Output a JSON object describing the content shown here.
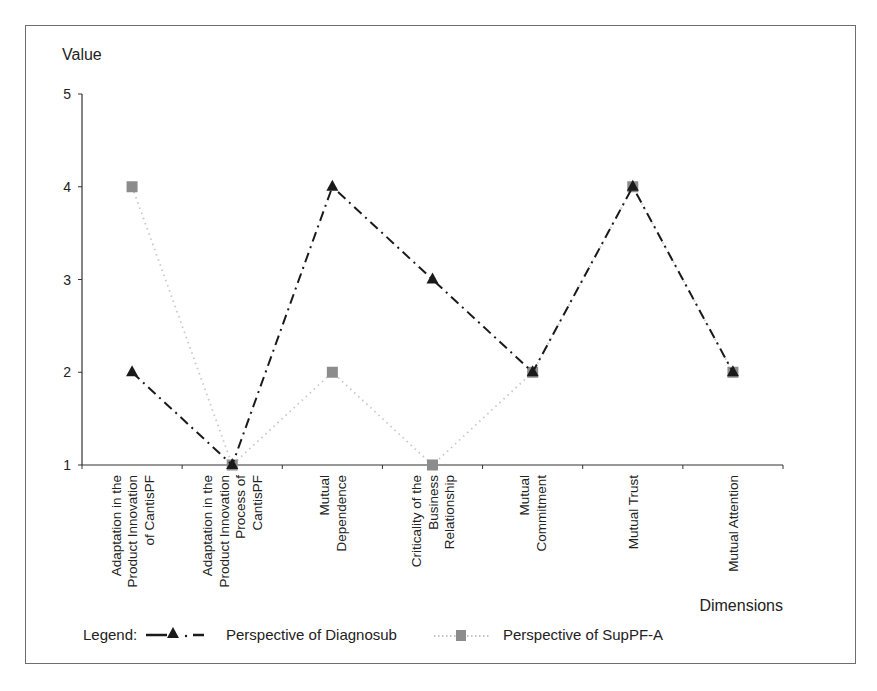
{
  "chart_data": {
    "type": "line",
    "title": "",
    "ylabel": "Value",
    "xlabel": "Dimensions",
    "ylim": [
      1,
      5
    ],
    "yticks": [
      1,
      2,
      3,
      4,
      5
    ],
    "grid": false,
    "legend_position": "bottom",
    "categories": [
      "Adaptation in the Product Innovation of CantisPF",
      "Adaptation in the Product Innovation Process of CantisPF",
      "Mutual Dependence",
      "Criticality of the Business Relationship",
      "Mutual Commitment",
      "Mutual Trust",
      "Mutual Attention"
    ],
    "category_label_lines": [
      [
        "Adaptation in the",
        "Product Innovation",
        "of CantisPF"
      ],
      [
        "Adaptation in the",
        "Product Innovation",
        "Process of",
        "CantisPF"
      ],
      [
        "Mutual",
        "Dependence"
      ],
      [
        "Criticality of the",
        "Business",
        "Relationship"
      ],
      [
        "Mutual",
        "Commitment"
      ],
      [
        "Mutual Trust"
      ],
      [
        "Mutual Attention"
      ]
    ],
    "series": [
      {
        "name": "Perspective of Diagnosub",
        "values": [
          2,
          1,
          4,
          3,
          2,
          4,
          2
        ],
        "marker": "triangle",
        "line_style": "dash-dot",
        "color": "#1a1a1a"
      },
      {
        "name": "Perspective of SupPF-A",
        "values": [
          4,
          1,
          2,
          1,
          2,
          4,
          2
        ],
        "marker": "square",
        "line_style": "dotted",
        "color": "#8c8c8c",
        "line_color": "#c8c8c8"
      }
    ]
  },
  "legend": {
    "prefix": "Legend:",
    "items": [
      {
        "label": "Perspective of Diagnosub"
      },
      {
        "label": "Perspective of SupPF-A"
      }
    ]
  },
  "colors": {
    "frame": "#6e6e6e",
    "axis": "#333333",
    "series_dark": "#1a1a1a",
    "series_gray_marker": "#8c8c8c",
    "series_gray_line": "#c8c8c8"
  }
}
